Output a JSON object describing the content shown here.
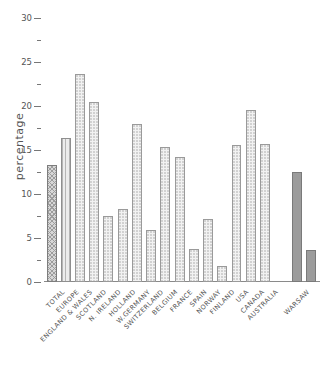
{
  "chart_data": {
    "type": "bar",
    "title": "",
    "xlabel": "",
    "ylabel": "percentage",
    "ylim": [
      0,
      30
    ],
    "yticks": [
      0,
      5,
      10,
      15,
      20,
      25,
      30
    ],
    "ytick_labels": [
      "0",
      "5",
      "10",
      "15",
      "20",
      "25",
      "30"
    ],
    "minor_yticks": [
      2.5,
      7.5,
      12.5,
      17.5,
      22.5,
      27.5
    ],
    "grid": false,
    "legend": "none",
    "categories": [
      "TOTAL",
      "EUROPE",
      "ENGLAND & WALES",
      "SCOTLAND",
      "N. IRELAND",
      "HOLLAND",
      "W.GERMANY",
      "SWITZERLAND",
      "BELGIUM",
      "FRANCE",
      "SPAIN",
      "NORWAY",
      "FINLAND",
      "USA",
      "CANADA",
      "AUSTRALIA",
      "WARSAW",
      ""
    ],
    "values": [
      13.3,
      16.4,
      23.6,
      20.4,
      7.5,
      8.3,
      17.9,
      5.9,
      15.3,
      14.2,
      3.8,
      7.2,
      1.8,
      15.6,
      19.5,
      15.7,
      12.5,
      3.6
    ],
    "bar_styles": [
      "cross",
      "vert",
      "dots",
      "dots",
      "dots",
      "dots",
      "dots",
      "dots",
      "dots",
      "dots",
      "dots",
      "dots",
      "dots",
      "dots",
      "dots",
      "dots",
      "solid",
      "solid"
    ],
    "gap_before_index": 16
  },
  "colors": {
    "axis": "#8a8a8a",
    "text": "#555555",
    "bar_light": "#f2f2f2",
    "bar_cross": "#d7d7d7",
    "bar_vert": "#ececec",
    "bar_solid": "#9c9c9c",
    "background": "#ffffff"
  }
}
